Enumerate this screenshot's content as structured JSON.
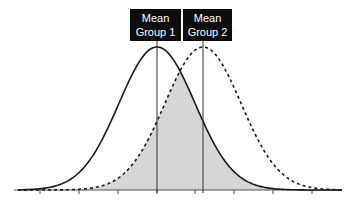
{
  "chart_data": {
    "type": "area",
    "title": "",
    "xlabel": "",
    "ylabel": "",
    "grid": false,
    "legend": "none",
    "series": [
      {
        "name": "Group 1",
        "distribution": "normal",
        "mean_px": 157,
        "sd_px": 38,
        "line_style": "solid",
        "color": "#1a1a1a"
      },
      {
        "name": "Group 2",
        "distribution": "normal",
        "mean_px": 203,
        "sd_px": 38,
        "line_style": "dashed",
        "color": "#1a1a1a"
      }
    ],
    "overlap_fill": "#d6d6d6",
    "x_ticks_px": [
      40,
      79,
      118,
      157,
      195,
      234,
      273,
      312
    ],
    "tick_labels": [],
    "annotations": [
      {
        "text_line1": "Mean",
        "text_line2": "Group 1",
        "x_px": 157
      },
      {
        "text_line1": "Mean",
        "text_line2": "Group 2",
        "x_px": 203
      }
    ]
  },
  "labels": {
    "group1": {
      "line1": "Mean",
      "line2": "Group 1"
    },
    "group2": {
      "line1": "Mean",
      "line2": "Group 2"
    }
  }
}
